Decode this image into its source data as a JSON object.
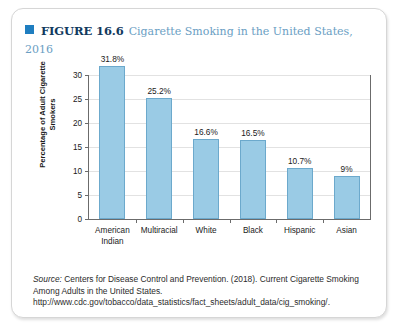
{
  "figure": {
    "marker_icon": "blue-square-icon",
    "label": "FIGURE 16.6",
    "title": "Cigarette Smoking in the United States, 2016"
  },
  "source": {
    "prefix": "Source:",
    "text": " Centers for Disease Control and Prevention. (2018). Current Cigarette Smoking Among Adults in the United States. http://www.cdc.gov/tobacco/data_statistics/fact_sheets/adult_data/cig_smoking/."
  },
  "colors": {
    "bar_fill": "#9acbe5",
    "bar_border": "#6ca9cc",
    "marker": "#1f7ec0",
    "label_text": "#123a5e",
    "title_text": "#6a9ec3",
    "axis": "#6b6b6b",
    "gridline": "#e2e2e2",
    "card_border": "#d6d6d6"
  },
  "chart_data": {
    "type": "bar",
    "title": "Cigarette Smoking in the United States, 2016",
    "xlabel": "",
    "ylabel": "Percentage of Adult Cigarette Smokers",
    "categories": [
      "American Indian",
      "Multiracial",
      "White",
      "Black",
      "Hispanic",
      "Asian"
    ],
    "category_lines": [
      [
        "American",
        "Indian"
      ],
      [
        "Multiracial"
      ],
      [
        "White"
      ],
      [
        "Black"
      ],
      [
        "Hispanic"
      ],
      [
        "Asian"
      ]
    ],
    "values": [
      31.8,
      25.2,
      16.6,
      16.5,
      10.7,
      9
    ],
    "data_labels": [
      "31.8%",
      "25.2%",
      "16.6%",
      "16.5%",
      "10.7%",
      "9%"
    ],
    "ylim": [
      0,
      30
    ],
    "yticks": [
      0,
      5,
      10,
      15,
      20,
      25,
      30
    ],
    "ytick_labels": [
      "0",
      "5",
      "10",
      "15",
      "20",
      "25",
      "30"
    ],
    "grid": true,
    "legend": false
  }
}
